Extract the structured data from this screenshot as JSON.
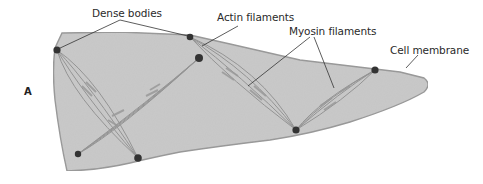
{
  "figure": {
    "panel_letter": "A",
    "labels": {
      "dense_bodies": "Dense bodies",
      "actin_filaments": "Actin filaments",
      "myosin_filaments": "Myosin filaments",
      "cell_membrane": "Cell membrane"
    },
    "colors": {
      "cell_fill": "#c9c9c9",
      "cell_stroke": "#9a9a9a",
      "filament": "#8e8e8e",
      "dense_body": "#333333",
      "leader_line": "#333333",
      "text": "#2a2a2a"
    },
    "dense_bodies": [
      {
        "x": 57,
        "y": 50,
        "r": 3.6
      },
      {
        "x": 190,
        "y": 37,
        "r": 3.3
      },
      {
        "x": 199,
        "y": 58,
        "r": 4
      },
      {
        "x": 78,
        "y": 154,
        "r": 3.2
      },
      {
        "x": 138,
        "y": 158,
        "r": 3.8
      },
      {
        "x": 296,
        "y": 130,
        "r": 3.6
      },
      {
        "x": 375,
        "y": 70,
        "r": 3.6
      }
    ]
  }
}
